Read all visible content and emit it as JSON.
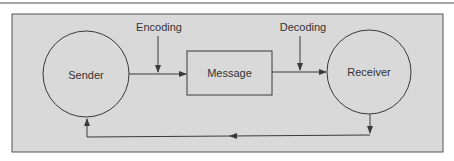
{
  "diagram": {
    "nodes": {
      "sender": "Sender",
      "message": "Message",
      "receiver": "Receiver"
    },
    "edge_labels": {
      "encoding": "Encoding",
      "decoding": "Decoding"
    },
    "colors": {
      "panel_fill": "#d9d9d9",
      "stroke": "#3a3a3a",
      "text": "#333333"
    }
  }
}
